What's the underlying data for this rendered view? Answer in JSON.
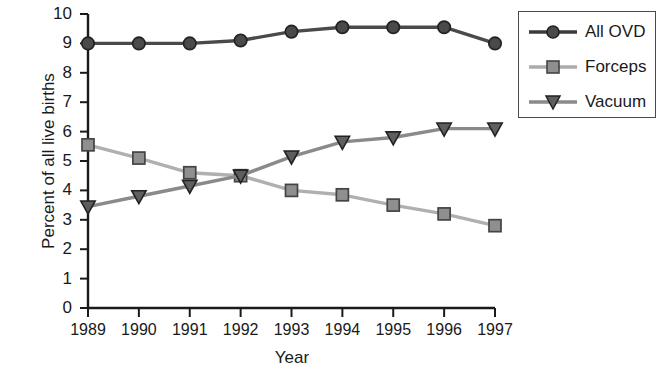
{
  "chart_data": {
    "type": "line",
    "title": "",
    "xlabel": "Year",
    "ylabel": "Percent of all live births",
    "categories": [
      "1989",
      "1990",
      "1991",
      "1992",
      "1993",
      "1994",
      "1995",
      "1996",
      "1997"
    ],
    "x": [
      1989,
      1990,
      1991,
      1992,
      1993,
      1994,
      1995,
      1996,
      1997
    ],
    "xlim": [
      1989,
      1997
    ],
    "ylim": [
      0,
      10
    ],
    "ytick_labels": [
      "0",
      "1",
      "2",
      "3",
      "4",
      "5",
      "6",
      "7",
      "8",
      "9",
      "10"
    ],
    "yticks": [
      0,
      1,
      2,
      3,
      4,
      5,
      6,
      7,
      8,
      9,
      10
    ],
    "grid": false,
    "legend_position": "top-right",
    "series": [
      {
        "name": "All OVD",
        "color": "#3c3c3c",
        "marker": "circle",
        "values": [
          9.0,
          9.0,
          9.0,
          9.1,
          9.4,
          9.55,
          9.55,
          9.55,
          9.0
        ]
      },
      {
        "name": "Forceps",
        "color": "#ababab",
        "marker": "square",
        "values": [
          5.55,
          5.1,
          4.6,
          4.5,
          4.0,
          3.85,
          3.5,
          3.2,
          2.8
        ]
      },
      {
        "name": "Vacuum",
        "color": "#6e6e6e",
        "marker": "triangle-down",
        "values": [
          3.45,
          3.8,
          4.15,
          4.5,
          5.15,
          5.65,
          5.8,
          6.1,
          6.1
        ]
      }
    ]
  },
  "legend": {
    "entries": [
      {
        "label": "All OVD"
      },
      {
        "label": "Forceps"
      },
      {
        "label": "Vacuum"
      }
    ]
  }
}
